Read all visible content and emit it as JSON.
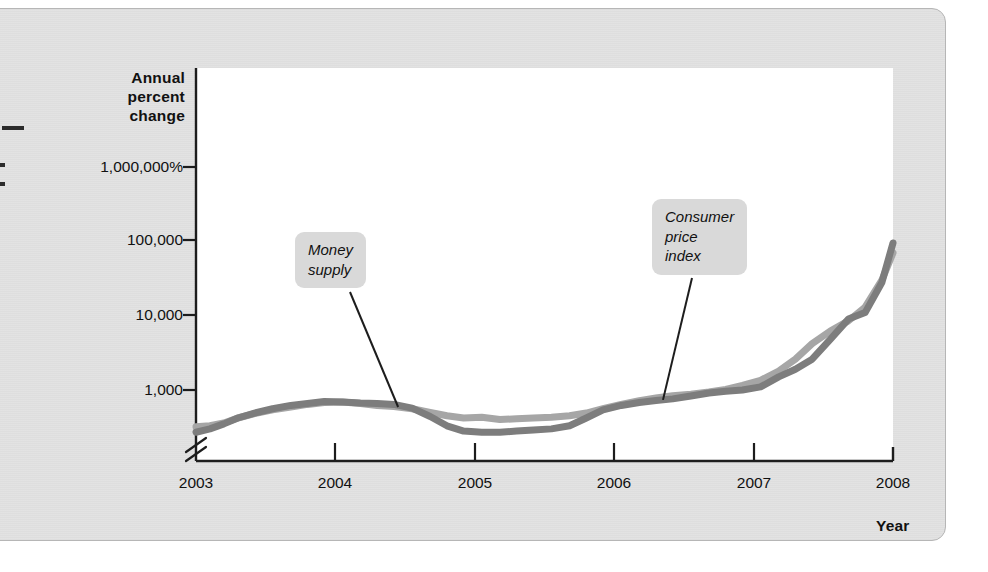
{
  "chart_data": {
    "type": "line",
    "title": "",
    "subtitle": "",
    "ylabel": "Annual percent change",
    "xlabel": "Year",
    "y_scale": "log",
    "y_axis_break": true,
    "grid": false,
    "legend_position": "inline-callouts",
    "ytick_labels": [
      "1,000,000%",
      "100,000",
      "10,000",
      "1,000"
    ],
    "ytick_values": [
      1000000,
      100000,
      10000,
      1000
    ],
    "xtick_labels": [
      "2003",
      "2004",
      "2005",
      "2006",
      "2007",
      "2008"
    ],
    "xtick_values": [
      2003,
      2004,
      2005,
      2006,
      2007,
      2008
    ],
    "xlim": [
      2003,
      2008
    ],
    "series": [
      {
        "name": "Money supply",
        "color": "#a6a6a6",
        "x": [
          2003.0,
          2003.1,
          2003.2,
          2003.3,
          2003.42,
          2003.55,
          2003.68,
          2003.8,
          2003.92,
          2004.05,
          2004.18,
          2004.3,
          2004.42,
          2004.55,
          2004.68,
          2004.8,
          2004.92,
          2005.05,
          2005.18,
          2005.3,
          2005.42,
          2005.55,
          2005.68,
          2005.8,
          2005.92,
          2006.05,
          2006.18,
          2006.3,
          2006.42,
          2006.55,
          2006.68,
          2006.8,
          2006.92,
          2007.05,
          2007.18,
          2007.3,
          2007.42,
          2007.55,
          2007.68,
          2007.8,
          2007.92,
          2008.0
        ],
        "values": [
          320,
          330,
          360,
          420,
          480,
          540,
          590,
          640,
          680,
          690,
          660,
          620,
          600,
          560,
          500,
          450,
          420,
          430,
          400,
          410,
          420,
          430,
          450,
          490,
          560,
          640,
          720,
          780,
          840,
          880,
          940,
          1020,
          1150,
          1350,
          1800,
          2600,
          4200,
          6200,
          8500,
          13000,
          30000,
          70000
        ],
        "values_note": "approximate annual percent change read off a logarithmic axis"
      },
      {
        "name": "Consumer price index",
        "color": "#7d7d7d",
        "x": [
          2003.0,
          2003.1,
          2003.2,
          2003.3,
          2003.42,
          2003.55,
          2003.68,
          2003.8,
          2003.92,
          2004.05,
          2004.18,
          2004.3,
          2004.42,
          2004.55,
          2004.68,
          2004.8,
          2004.92,
          2005.05,
          2005.18,
          2005.3,
          2005.42,
          2005.55,
          2005.68,
          2005.8,
          2005.92,
          2006.05,
          2006.18,
          2006.3,
          2006.42,
          2006.55,
          2006.68,
          2006.8,
          2006.92,
          2007.05,
          2007.18,
          2007.3,
          2007.42,
          2007.55,
          2007.68,
          2007.8,
          2007.92,
          2008.0
        ],
        "values": [
          270,
          300,
          350,
          420,
          490,
          560,
          620,
          660,
          700,
          690,
          670,
          660,
          640,
          570,
          440,
          330,
          280,
          270,
          270,
          280,
          290,
          300,
          330,
          420,
          540,
          620,
          680,
          720,
          760,
          830,
          910,
          960,
          1000,
          1100,
          1500,
          1900,
          2600,
          4800,
          9000,
          11000,
          28000,
          95000
        ],
        "values_note": "approximate annual percent change read off a logarithmic axis"
      }
    ],
    "annotations": [
      {
        "name": "money-supply-callout",
        "text": "Money\nsupply",
        "points_to_series": "Money supply",
        "points_to_x": 2004.45
      },
      {
        "name": "cpi-callout",
        "text": "Consumer\nprice\nindex",
        "points_to_series": "Consumer price index",
        "points_to_x": 2006.35
      }
    ]
  }
}
